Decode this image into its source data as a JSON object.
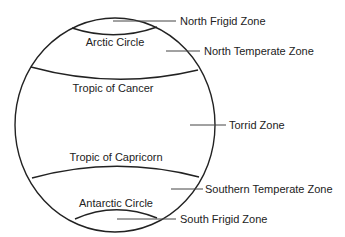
{
  "diagram": {
    "circle_labels": {
      "arctic_circle": "Arctic Circle",
      "tropic_of_cancer": "Tropic of Cancer",
      "tropic_of_capricorn": "Tropic of Capricorn",
      "antarctic_circle": "Antarctic Circle"
    },
    "zone_labels": {
      "north_frigid": "North Frigid Zone",
      "north_temperate": "North Temperate Zone",
      "torrid": "Torrid Zone",
      "southern_temperate": "Southern Temperate Zone",
      "south_frigid": "South Frigid Zone"
    },
    "colors": {
      "stroke": "#222222",
      "leader": "#444444",
      "background": "#ffffff"
    }
  }
}
